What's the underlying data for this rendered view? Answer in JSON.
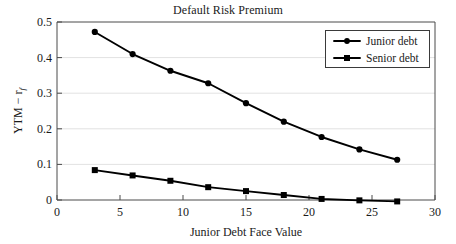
{
  "chart_data": {
    "type": "line",
    "title": "Default Risk Premium",
    "xlabel": "Junior Debt Face Value",
    "ylabel": "YTM − r",
    "ylabel_subscript": "f",
    "x": [
      3,
      6,
      9,
      12,
      15,
      18,
      21,
      24,
      27
    ],
    "xlim": [
      0,
      30
    ],
    "ylim": [
      0,
      0.5
    ],
    "xticks": [
      "0",
      "5",
      "10",
      "15",
      "20",
      "25",
      "30"
    ],
    "xtick_values": [
      0,
      5,
      10,
      15,
      20,
      25,
      30
    ],
    "yticks": [
      "0",
      "0.1",
      "0.2",
      "0.3",
      "0.4",
      "0.5"
    ],
    "ytick_values": [
      0,
      0.1,
      0.2,
      0.3,
      0.4,
      0.5
    ],
    "grid": "horizontal",
    "legend_position": "top-right",
    "series": [
      {
        "name": "Junior debt",
        "marker": "circle",
        "color": "#000000",
        "values": [
          0.472,
          0.41,
          0.363,
          0.328,
          0.272,
          0.22,
          0.177,
          0.142,
          0.113
        ]
      },
      {
        "name": "Senior debt",
        "marker": "square",
        "color": "#000000",
        "values": [
          0.084,
          0.069,
          0.054,
          0.036,
          0.025,
          0.014,
          0.003,
          -0.001,
          -0.004
        ]
      }
    ]
  },
  "legend": {
    "items": [
      {
        "label": "Junior debt",
        "marker": "circle"
      },
      {
        "label": "Senior debt",
        "marker": "square"
      }
    ]
  }
}
